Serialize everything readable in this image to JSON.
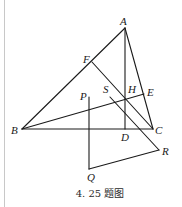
{
  "figure": {
    "caption": "4. 25 题图",
    "points": {
      "A": {
        "label": "A",
        "x": 125,
        "y": 28
      },
      "B": {
        "label": "B",
        "x": 22,
        "y": 129
      },
      "C": {
        "label": "C",
        "x": 153,
        "y": 129
      },
      "D": {
        "label": "D",
        "x": 125,
        "y": 129
      },
      "E": {
        "label": "E",
        "x": 144,
        "y": 94
      },
      "F": {
        "label": "F",
        "x": 92,
        "y": 62
      },
      "H": {
        "label": "H",
        "x": 125,
        "y": 98
      },
      "S": {
        "label": "S",
        "x": 111,
        "y": 96
      },
      "P": {
        "label": "P",
        "x": 89,
        "y": 97
      },
      "Q": {
        "label": "Q",
        "x": 89,
        "y": 169
      },
      "R": {
        "label": "R",
        "x": 159,
        "y": 150
      }
    },
    "segments": [
      [
        "A",
        "B"
      ],
      [
        "B",
        "C"
      ],
      [
        "C",
        "A"
      ],
      [
        "A",
        "D"
      ],
      [
        "B",
        "E"
      ],
      [
        "C",
        "F"
      ],
      [
        "S",
        "R"
      ],
      [
        "R",
        "Q"
      ],
      [
        "Q",
        "P"
      ]
    ],
    "colors": {
      "stroke": "#1a1a1a",
      "rule": "#c8c8c8"
    }
  }
}
